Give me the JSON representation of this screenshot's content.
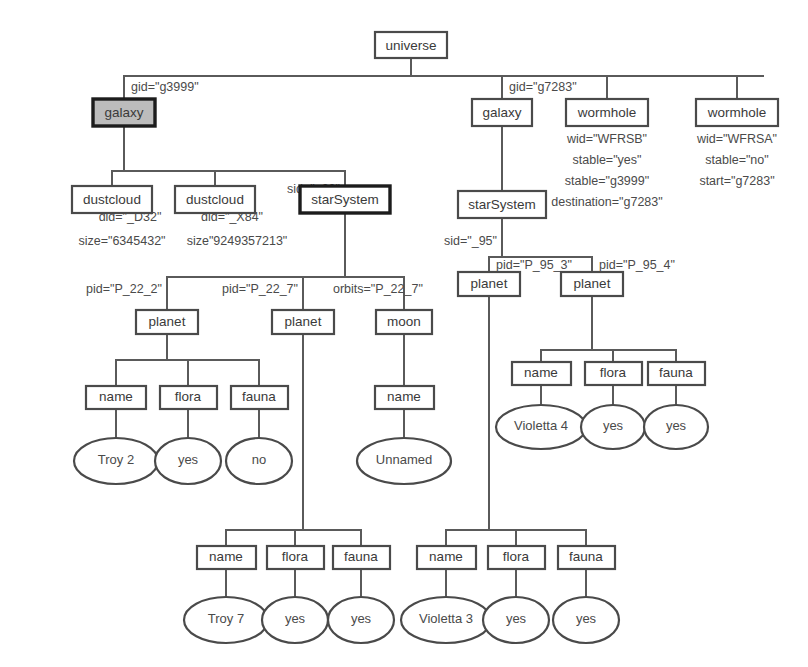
{
  "diagram": {
    "type": "xml-tree",
    "colors": {
      "line": "#5a5a5a",
      "box_stroke": "#4a4a4a",
      "selected_stroke": "#1c1c1c",
      "highlight_fill": "#bcbcbc",
      "background": "#ffffff",
      "text": "#3a3a3a"
    }
  },
  "nodes": {
    "universe": "universe",
    "galaxy_left": "galaxy",
    "galaxy_right": "galaxy",
    "wormhole_b": "wormhole",
    "wormhole_a": "wormhole",
    "dustcloud_1": "dustcloud",
    "dustcloud_2": "dustcloud",
    "starsystem_22": "starSystem",
    "starsystem_95": "starSystem",
    "planet_22_2": "planet",
    "planet_22_7": "planet",
    "moon_22_7": "moon",
    "planet_95_3": "planet",
    "planet_95_4": "planet",
    "name_1": "name",
    "flora_1": "flora",
    "fauna_1": "fauna",
    "name_moon": "name",
    "name_95_4": "name",
    "flora_95_4": "flora",
    "fauna_95_4": "fauna",
    "name_22_7": "name",
    "flora_22_7": "flora",
    "fauna_22_7": "fauna",
    "name_95_3": "name",
    "flora_95_3": "flora",
    "fauna_95_3": "fauna"
  },
  "leaves": {
    "troy2": "Troy 2",
    "flora1_val": "yes",
    "fauna1_val": "no",
    "unnamed": "Unnamed",
    "violetta4": "Violetta 4",
    "flora954_val": "yes",
    "fauna954_val": "yes",
    "troy7": "Troy 7",
    "flora227_val": "yes",
    "fauna227_val": "yes",
    "violetta3": "Violetta 3",
    "flora953_val": "yes",
    "fauna953_val": "yes"
  },
  "attributes": {
    "gid_g3999": "gid=\"g3999\"",
    "gid_g7283": "gid=\"g7283\"",
    "sid_22": "sid=\"_22\"",
    "sid_95": "sid=\"_95\"",
    "did_d32": "did=\"_D32\"",
    "size_d32": "size=\"6345432\"",
    "did_x84": "did=\"_X84\"",
    "size_x84": "size\"9249357213\"",
    "wh_b_wid": "wid=\"WFRSB\"",
    "wh_b_stable": "stable=\"yes\"",
    "wh_b_start": "stable=\"g3999\"",
    "wh_b_destination": "destination=\"g7283\"",
    "wh_a_wid": "wid=\"WFRSA\"",
    "wh_a_stable": "stable=\"no\"",
    "wh_a_start": "start=\"g7283\"",
    "pid_22_2": "pid=\"P_22_2\"",
    "pid_22_7": "pid=\"P_22_7\"",
    "orbits_22_7": "orbits=\"P_22_7\"",
    "pid_95_3": "pid=\"P_95_3\"",
    "pid_95_4": "pid=\"P_95_4\""
  }
}
